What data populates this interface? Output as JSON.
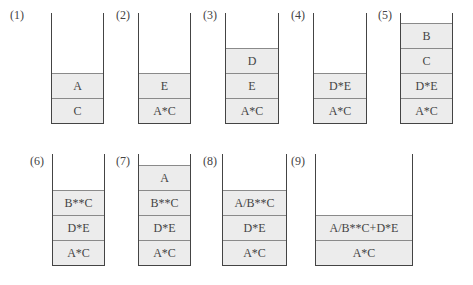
{
  "stacks": [
    {
      "label": "(1)",
      "cells": [
        "C",
        "A"
      ]
    },
    {
      "label": "(2)",
      "cells": [
        "A*C",
        "E"
      ]
    },
    {
      "label": "(3)",
      "cells": [
        "A*C",
        "E",
        "D"
      ]
    },
    {
      "label": "(4)",
      "cells": [
        "A*C",
        "D*E"
      ]
    },
    {
      "label": "(5)",
      "cells": [
        "A*C",
        "D*E",
        "C",
        "B"
      ]
    },
    {
      "label": "(6)",
      "cells": [
        "A*C",
        "D*E",
        "B**C"
      ]
    },
    {
      "label": "(7)",
      "cells": [
        "A*C",
        "D*E",
        "B**C",
        "A"
      ]
    },
    {
      "label": "(8)",
      "cells": [
        "A*C",
        "D*E",
        "A/B**C"
      ]
    },
    {
      "label": "(9)",
      "cells": [
        "A*C",
        "A/B**C+D*E"
      ]
    }
  ]
}
